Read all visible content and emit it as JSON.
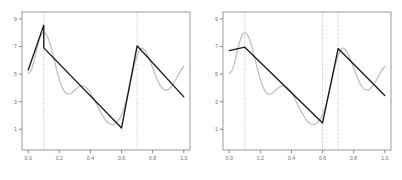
{
  "figure": {
    "title": "",
    "panel_count": 2,
    "background": "#ffffff"
  },
  "colors": {
    "smooth_curve": "#c0c0c0",
    "piecewise_curve": "#1a1a1a",
    "axis": "#6e6e6e",
    "frame": "#808080",
    "reference_line": "#9a9a9a",
    "tick_text": "#6e6e6e"
  },
  "chart_data": [
    {
      "type": "line",
      "panel": "left",
      "title": "",
      "xlabel": "",
      "ylabel": "",
      "xlim": [
        -0.04,
        1.04
      ],
      "ylim": [
        -0.5,
        9.5
      ],
      "grid": false,
      "legend": null,
      "xticks": [
        0.0,
        0.2,
        0.4,
        0.6,
        0.8,
        1.0
      ],
      "xticklabels": [
        "0.0",
        "0.2",
        "0.4",
        "0.6",
        "0.8",
        "1.0"
      ],
      "yticks": [
        9,
        7,
        5,
        3,
        1
      ],
      "yticklabels": [
        "9",
        "7",
        "5",
        "3",
        "1"
      ],
      "vlines": [
        0.1,
        0.7
      ],
      "vline_style": "dotted",
      "series": [
        {
          "name": "smooth-curve",
          "style": "solid",
          "color": "#c0c0c0",
          "x": [
            0.0,
            0.02,
            0.04,
            0.06,
            0.08,
            0.1,
            0.12,
            0.14,
            0.16,
            0.18,
            0.2,
            0.22,
            0.24,
            0.26,
            0.28,
            0.3,
            0.32,
            0.34,
            0.36,
            0.38,
            0.4,
            0.42,
            0.44,
            0.46,
            0.48,
            0.5,
            0.52,
            0.54,
            0.56,
            0.58,
            0.6,
            0.62,
            0.64,
            0.66,
            0.68,
            0.7,
            0.72,
            0.74,
            0.76,
            0.78,
            0.8,
            0.82,
            0.84,
            0.86,
            0.88,
            0.9,
            0.92,
            0.94,
            0.96,
            0.98,
            1.0
          ],
          "y": [
            5.05,
            5.3,
            6.1,
            7.05,
            7.75,
            8.0,
            7.8,
            7.2,
            6.35,
            5.45,
            4.6,
            4.0,
            3.65,
            3.55,
            3.65,
            3.85,
            4.05,
            4.15,
            4.12,
            3.95,
            3.65,
            3.25,
            2.8,
            2.35,
            1.95,
            1.62,
            1.42,
            1.35,
            1.42,
            1.65,
            2.05,
            2.7,
            3.55,
            4.55,
            5.55,
            6.35,
            6.8,
            6.85,
            6.55,
            6.05,
            5.45,
            4.85,
            4.35,
            4.0,
            3.85,
            3.88,
            4.1,
            4.45,
            4.85,
            5.25,
            5.55
          ]
        },
        {
          "name": "piecewise-linear-fit",
          "style": "solid",
          "color": "#1a1a1a",
          "x": [
            0.0,
            0.1,
            0.1,
            0.6,
            0.7,
            1.0
          ],
          "y": [
            5.3,
            8.55,
            6.9,
            1.1,
            7.05,
            3.35
          ],
          "knots": [
            0.1,
            0.7
          ]
        }
      ]
    },
    {
      "type": "line",
      "panel": "right",
      "title": "",
      "xlabel": "",
      "ylabel": "",
      "xlim": [
        -0.04,
        1.04
      ],
      "ylim": [
        -0.5,
        9.5
      ],
      "grid": false,
      "legend": null,
      "xticks": [
        0.0,
        0.2,
        0.4,
        0.6,
        0.8,
        1.0
      ],
      "xticklabels": [
        "0.0",
        "0.2",
        "0.4",
        "0.6",
        "0.8",
        "1.0"
      ],
      "yticks": [
        9,
        7,
        5,
        3,
        1
      ],
      "yticklabels": [
        "9",
        "7",
        "5",
        "3",
        "1"
      ],
      "vlines": [
        0.1,
        0.6,
        0.7
      ],
      "vline_style": "dotted",
      "series": [
        {
          "name": "smooth-curve",
          "style": "solid",
          "color": "#c0c0c0",
          "x": [
            0.0,
            0.02,
            0.04,
            0.06,
            0.08,
            0.1,
            0.12,
            0.14,
            0.16,
            0.18,
            0.2,
            0.22,
            0.24,
            0.26,
            0.28,
            0.3,
            0.32,
            0.34,
            0.36,
            0.38,
            0.4,
            0.42,
            0.44,
            0.46,
            0.48,
            0.5,
            0.52,
            0.54,
            0.56,
            0.58,
            0.6,
            0.62,
            0.64,
            0.66,
            0.68,
            0.7,
            0.72,
            0.74,
            0.76,
            0.78,
            0.8,
            0.82,
            0.84,
            0.86,
            0.88,
            0.9,
            0.92,
            0.94,
            0.96,
            0.98,
            1.0
          ],
          "y": [
            5.05,
            5.3,
            6.1,
            7.05,
            7.75,
            8.0,
            7.8,
            7.2,
            6.35,
            5.45,
            4.6,
            4.0,
            3.65,
            3.55,
            3.65,
            3.85,
            4.05,
            4.15,
            4.12,
            3.95,
            3.65,
            3.25,
            2.8,
            2.35,
            1.95,
            1.62,
            1.42,
            1.35,
            1.42,
            1.65,
            2.05,
            2.7,
            3.55,
            4.55,
            5.55,
            6.35,
            6.8,
            6.85,
            6.55,
            6.05,
            5.45,
            4.85,
            4.35,
            4.0,
            3.85,
            3.88,
            4.1,
            4.45,
            4.85,
            5.25,
            5.55
          ]
        },
        {
          "name": "piecewise-linear-fit",
          "style": "solid",
          "color": "#1a1a1a",
          "x": [
            0.0,
            0.1,
            0.6,
            0.7,
            1.0
          ],
          "y": [
            6.7,
            6.95,
            1.45,
            6.85,
            3.45
          ],
          "knots": [
            0.1,
            0.6,
            0.7
          ]
        }
      ]
    }
  ]
}
